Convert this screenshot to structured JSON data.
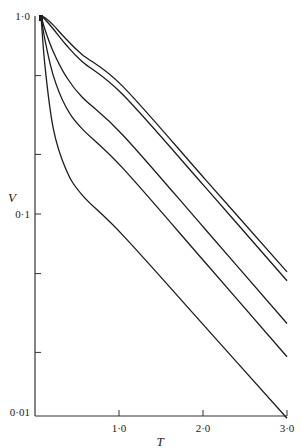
{
  "chart_data": {
    "type": "line",
    "title": "",
    "xlabel": "T",
    "ylabel": "V",
    "xscale": "linear",
    "yscale": "log",
    "xlim": [
      0,
      3.0
    ],
    "ylim": [
      0.01,
      1.0
    ],
    "grid": false,
    "legend": null,
    "x_ticks": [
      {
        "value": 1.0,
        "label": "1·0"
      },
      {
        "value": 2.0,
        "label": "2·0"
      },
      {
        "value": 3.0,
        "label": "3·0"
      }
    ],
    "y_ticks": [
      {
        "value": 1.0,
        "label": "1·0"
      },
      {
        "value": 0.5,
        "label": ""
      },
      {
        "value": 0.2,
        "label": ""
      },
      {
        "value": 0.1,
        "label": "0·1"
      },
      {
        "value": 0.05,
        "label": ""
      },
      {
        "value": 0.02,
        "label": ""
      },
      {
        "value": 0.01,
        "label": "0·01"
      }
    ],
    "series": [
      {
        "name": "curve-1",
        "x": [
          0,
          0.05,
          0.15,
          0.3,
          0.5,
          1.0,
          2.0,
          3.0
        ],
        "y": [
          1.0,
          0.98,
          0.9,
          0.77,
          0.64,
          0.44,
          0.15,
          0.051
        ]
      },
      {
        "name": "curve-2",
        "x": [
          0,
          0.05,
          0.15,
          0.3,
          0.5,
          1.0,
          2.0,
          3.0
        ],
        "y": [
          1.0,
          0.96,
          0.86,
          0.72,
          0.59,
          0.4,
          0.137,
          0.046
        ]
      },
      {
        "name": "curve-3",
        "x": [
          0,
          0.05,
          0.15,
          0.3,
          0.5,
          1.0,
          2.0,
          3.0
        ],
        "y": [
          1.0,
          0.85,
          0.66,
          0.5,
          0.39,
          0.25,
          0.084,
          0.028
        ]
      },
      {
        "name": "curve-4",
        "x": [
          0,
          0.05,
          0.15,
          0.3,
          0.5,
          1.0,
          2.0,
          3.0
        ],
        "y": [
          1.0,
          0.75,
          0.5,
          0.35,
          0.27,
          0.17,
          0.057,
          0.019
        ]
      },
      {
        "name": "curve-5",
        "x": [
          0,
          0.05,
          0.15,
          0.3,
          0.5,
          1.0,
          2.0,
          3.0
        ],
        "y": [
          1.0,
          0.55,
          0.27,
          0.17,
          0.125,
          0.078,
          0.027,
          0.0093
        ]
      }
    ]
  },
  "style": {
    "line_color": "#1c1c1c",
    "axis_color": "#333333",
    "background": "#ffffff"
  },
  "layout": {
    "origin_px": [
      35,
      16
    ],
    "x_px_per_unit": 84,
    "y_px_per_decade": 198,
    "x_axis_y_px": 416,
    "y_axis_x_px": 35,
    "curve_start_px": [
      41,
      16
    ]
  }
}
